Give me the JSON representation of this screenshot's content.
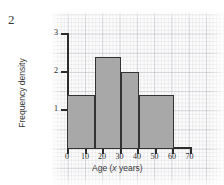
{
  "question_number": "2",
  "chart_data": {
    "type": "bar",
    "title": "",
    "xlabel": "Age (x years)",
    "ylabel": "Frequency density",
    "xlim": [
      0,
      70
    ],
    "ylim": [
      0,
      3
    ],
    "grid": true,
    "legend": "none",
    "x_ticks": [
      "0",
      "10",
      "20",
      "30",
      "40",
      "50",
      "60",
      "70"
    ],
    "x_tick_values": [
      0,
      10,
      20,
      30,
      40,
      50,
      60,
      70
    ],
    "y_ticks": [
      "1",
      "2",
      "3"
    ],
    "y_tick_values": [
      1,
      2,
      3
    ],
    "bars": [
      {
        "start": 5,
        "end": 20,
        "value": 1.4
      },
      {
        "start": 20,
        "end": 35,
        "value": 2.4
      },
      {
        "start": 35,
        "end": 45,
        "value": 2.0
      },
      {
        "start": 45,
        "end": 65,
        "value": 1.4
      }
    ],
    "bar_fill_color": "#a8a8a8",
    "bar_edge_color": "#333333"
  },
  "colors": {
    "paper": "#fbfbfb",
    "grid": "#9696a5",
    "axis": "#2c2c2c",
    "text": "#3a3a3a"
  }
}
